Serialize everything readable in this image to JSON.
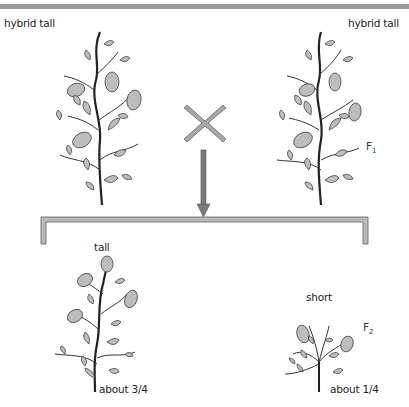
{
  "parents": {
    "left_label": "hybrid tall",
    "right_label": "hybrid tall",
    "generation": {
      "letter": "F",
      "index": "1"
    }
  },
  "cross_symbol": "×",
  "offspring": {
    "tall": {
      "label": "tall",
      "ratio": "about 3/4"
    },
    "short": {
      "label": "short",
      "ratio": "about 1/4"
    },
    "generation": {
      "letter": "F",
      "index": "2"
    }
  },
  "colors": {
    "topbar": "#9a9a9a",
    "bracket_fill": "#b8b8b8",
    "bracket_stroke": "#6e6e6e",
    "arrow": "#7a7a7a",
    "cross": "#a8a8a8",
    "leaf": "#bdbdbd",
    "stem": "#333333"
  }
}
